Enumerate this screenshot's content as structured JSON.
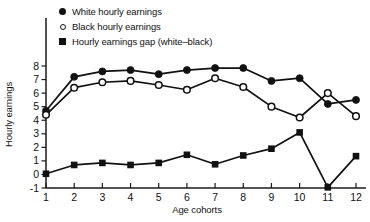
{
  "chart_data": {
    "type": "line",
    "title": "",
    "xlabel": "Age cohorts",
    "ylabel": "Hourly earnings",
    "categories": [
      "1",
      "2",
      "3",
      "4",
      "5",
      "6",
      "7",
      "8",
      "9",
      "10",
      "11",
      "12"
    ],
    "x": [
      1,
      2,
      3,
      4,
      5,
      6,
      7,
      8,
      9,
      10,
      11,
      12
    ],
    "xlim": [
      1,
      12
    ],
    "ylim": [
      -1,
      8
    ],
    "yticks": [
      -1,
      0,
      1,
      2,
      3,
      4,
      5,
      6,
      7,
      8
    ],
    "ytick_labels": [
      "-1",
      "0",
      "1",
      "2",
      "3",
      "4",
      "5",
      "6",
      "7",
      "8"
    ],
    "xticks": [
      1,
      2,
      3,
      4,
      5,
      6,
      7,
      8,
      9,
      10,
      11,
      12
    ],
    "xtick_labels": [
      "1",
      "2",
      "3",
      "4",
      "5",
      "6",
      "7",
      "8",
      "9",
      "10",
      "11",
      "12"
    ],
    "grid": false,
    "legend_position": "top-left",
    "series": [
      {
        "name": "White hourly earnings",
        "marker": "filled-circle",
        "color": "#111111",
        "values": [
          4.7,
          7.2,
          7.6,
          7.7,
          7.4,
          7.7,
          7.85,
          7.85,
          6.9,
          7.1,
          5.2,
          5.5
        ]
      },
      {
        "name": "Black hourly earnings",
        "marker": "open-circle",
        "color": "#111111",
        "values": [
          4.4,
          6.4,
          6.8,
          6.9,
          6.6,
          6.25,
          7.1,
          6.45,
          5.0,
          4.2,
          6.0,
          4.3
        ]
      },
      {
        "name": "Hourly earnings gap (white–black)",
        "marker": "filled-square",
        "color": "#111111",
        "values": [
          0.05,
          0.7,
          0.85,
          0.7,
          0.85,
          1.45,
          0.75,
          1.4,
          1.9,
          3.1,
          -0.95,
          1.35
        ]
      }
    ]
  },
  "legend": {
    "items": [
      {
        "label": "White hourly earnings",
        "marker": "filled-circle"
      },
      {
        "label": "Black hourly earnings",
        "marker": "open-circle"
      },
      {
        "label": "Hourly earnings gap (white–black)",
        "marker": "filled-square"
      }
    ]
  },
  "axes": {
    "x_axis_title": "Age cohorts",
    "y_axis_title": "Hourly earnings"
  }
}
